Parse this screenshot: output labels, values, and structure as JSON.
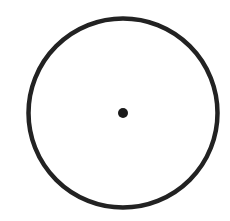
{
  "figure": {
    "width": 230,
    "height": 221,
    "background": "#ffffff",
    "circle": {
      "cx": 123,
      "cy": 113,
      "r": 94.5,
      "stroke": "#222222",
      "stroke_width": 4.5
    },
    "center_point": {
      "cx": 123,
      "cy": 113,
      "r": 5,
      "fill": "#1a1a1a"
    }
  }
}
